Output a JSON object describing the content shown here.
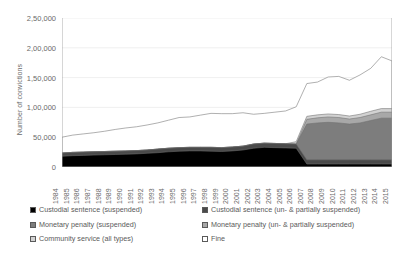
{
  "chart_data": {
    "type": "area",
    "title": "",
    "xlabel": "",
    "ylabel": "Number of convictions",
    "ylim": [
      0,
      250000
    ],
    "yticks": [
      0,
      50000,
      100000,
      150000,
      200000,
      250000
    ],
    "ytick_labels": [
      "0",
      "50,000",
      "1,00,000",
      "1,50,000",
      "2,00,000",
      "2,50,000"
    ],
    "grid": true,
    "stacked": true,
    "legend_position": "bottom",
    "x": [
      1984,
      1985,
      1986,
      1987,
      1988,
      1989,
      1990,
      1991,
      1992,
      1993,
      1994,
      1995,
      1996,
      1997,
      1998,
      1999,
      2000,
      2001,
      2002,
      2003,
      2004,
      2005,
      2006,
      2007,
      2008,
      2009,
      2010,
      2011,
      2012,
      2013,
      2014,
      2015
    ],
    "categories": [
      "1984",
      "1985",
      "1986",
      "1987",
      "1988",
      "1989",
      "1990",
      "1991",
      "1992",
      "1993",
      "1994",
      "1995",
      "1996",
      "1997",
      "1998",
      "1999",
      "2000",
      "2001",
      "2002",
      "2003",
      "2004",
      "2005",
      "2006",
      "2007",
      "2008",
      "2009",
      "2010",
      "2011",
      "2012",
      "2013",
      "2014",
      "2015"
    ],
    "series": [
      {
        "name": "Custodial sentence (suspended)",
        "color": "#000000",
        "values": [
          18000,
          19000,
          19500,
          20000,
          20500,
          21000,
          21500,
          22000,
          23000,
          24000,
          25500,
          26500,
          27000,
          27000,
          26500,
          26000,
          27000,
          28500,
          31500,
          33000,
          32500,
          32000,
          31500,
          5000,
          5000,
          5000,
          5000,
          5000,
          5000,
          5000,
          5000,
          5000
        ]
      },
      {
        "name": "Custodial sentence (un- & partially suspended)",
        "color": "#4a4a4a",
        "values": [
          5500,
          5500,
          5500,
          5500,
          5500,
          5500,
          5500,
          5500,
          5500,
          6000,
          6000,
          6000,
          6000,
          6000,
          6500,
          6500,
          6500,
          6500,
          7000,
          7000,
          7000,
          7000,
          7000,
          7000,
          7000,
          7000,
          7000,
          7000,
          7000,
          7000,
          7000,
          7000
        ]
      },
      {
        "name": "Monetary penalty (suspended)",
        "color": "#7d7d7d",
        "values": [
          0,
          0,
          0,
          0,
          0,
          0,
          0,
          0,
          0,
          0,
          0,
          0,
          0,
          0,
          0,
          0,
          0,
          0,
          0,
          0,
          0,
          0,
          0,
          60000,
          62000,
          63000,
          62000,
          60000,
          62000,
          66000,
          70000,
          70000
        ]
      },
      {
        "name": "Monetary penalty (un- & partially suspended)",
        "color": "#a8a8a8",
        "values": [
          0,
          0,
          0,
          0,
          0,
          0,
          0,
          0,
          0,
          0,
          0,
          0,
          0,
          0,
          0,
          0,
          0,
          0,
          0,
          0,
          0,
          0,
          0,
          8000,
          8500,
          9000,
          9000,
          8500,
          9000,
          9500,
          10000,
          10000
        ]
      },
      {
        "name": "Community service (all types)",
        "color": "#d2d2d2",
        "values": [
          0,
          0,
          0,
          0,
          0,
          0,
          0,
          0,
          0,
          0,
          0,
          0,
          0,
          0,
          0,
          0,
          0,
          0,
          0,
          0,
          0,
          0,
          4000,
          5000,
          5000,
          5000,
          5000,
          5000,
          5500,
          6000,
          6000,
          6000
        ]
      },
      {
        "name": "Fine",
        "color": "#ffffff",
        "values": [
          26500,
          29000,
          30500,
          32000,
          34000,
          36500,
          38500,
          40000,
          42000,
          44000,
          47000,
          50500,
          51000,
          54000,
          57000,
          57000,
          56000,
          56000,
          50000,
          50000,
          52500,
          55000,
          58500,
          55000,
          55000,
          62000,
          64000,
          60000,
          66000,
          72000,
          87000,
          80000
        ]
      }
    ],
    "totals": [
      50000,
      53500,
      55500,
      57500,
      60000,
      63000,
      65500,
      67500,
      70500,
      74000,
      78500,
      83000,
      84000,
      87000,
      90000,
      89500,
      89500,
      91000,
      88500,
      90000,
      92000,
      94000,
      101000,
      140000,
      142500,
      151000,
      152000,
      145500,
      154500,
      165500,
      185000,
      178000
    ]
  },
  "legend": {
    "items": [
      {
        "label": "Custodial sentence (suspended)",
        "swatch": "solid-black"
      },
      {
        "label": "Custodial sentence (un- & partially suspended)",
        "swatch": "solid-dark-gray"
      },
      {
        "label": "Monetary penalty (suspended)",
        "swatch": "solid-mid-gray"
      },
      {
        "label": "Monetary penalty (un- & partially suspended)",
        "swatch": "solid-light-gray"
      },
      {
        "label": "Community service (all types)",
        "swatch": "solid-pale-gray"
      },
      {
        "label": "Fine",
        "swatch": "white"
      }
    ]
  },
  "colors": {
    "custodial_suspended": "#000000",
    "custodial_unsuspended": "#4a4a4a",
    "monetary_suspended": "#7d7d7d",
    "monetary_unsuspended": "#a8a8a8",
    "community_service": "#d2d2d2",
    "fine": "#ffffff",
    "axis": "#9a9a9a",
    "grid": "#ebebeb",
    "text": "#5a5a5a"
  }
}
